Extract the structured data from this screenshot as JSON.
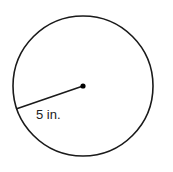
{
  "diagram": {
    "shape": "circle",
    "center": {
      "x": 83,
      "y": 86
    },
    "radius_px": 70,
    "radius_line": {
      "x1": 83,
      "y1": 86,
      "x2": 16,
      "y2": 109
    },
    "radius_label": "5 in.",
    "stroke_color": "#1a1a1a",
    "background": "#ffffff"
  }
}
